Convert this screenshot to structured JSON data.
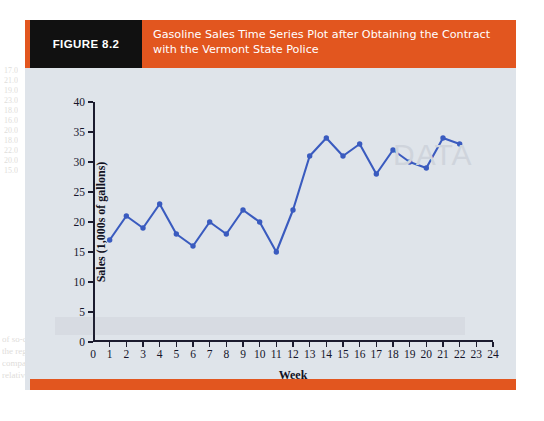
{
  "figure": {
    "tag": "FIGURE 8.2",
    "title": "Gasoline Sales Time Series Plot after Obtaining the Contract with the Vermont State Police",
    "header_color": "#e2561f",
    "tag_color": "#111111",
    "panel_color": "#dfe4ea"
  },
  "watermark": {
    "text": "DATA"
  },
  "page_bleed": [
    {
      "text": "17.0",
      "x": 4,
      "y": 66
    },
    {
      "text": "21.0",
      "x": 4,
      "y": 76
    },
    {
      "text": "19.0",
      "x": 4,
      "y": 86
    },
    {
      "text": "23.0",
      "x": 4,
      "y": 96
    },
    {
      "text": "18.0",
      "x": 4,
      "y": 106
    },
    {
      "text": "16.0",
      "x": 4,
      "y": 116
    },
    {
      "text": "20.0",
      "x": 4,
      "y": 126
    },
    {
      "text": "18.0",
      "x": 4,
      "y": 136
    },
    {
      "text": "22.0",
      "x": 4,
      "y": 146
    },
    {
      "text": "20.0",
      "x": 4,
      "y": 156
    },
    {
      "text": "15.0",
      "x": 4,
      "y": 166
    },
    {
      "text": "of so-called data increases by exception and the from time you to",
      "x": 2,
      "y": 334
    },
    {
      "text": "the regression appears to be growing at an exponential fashion. Figure",
      "x": 2,
      "y": 346
    },
    {
      "text": "comparison of seasonal and irregular components and trend in sales",
      "x": 2,
      "y": 358
    },
    {
      "text": "relatively constant.",
      "x": 2,
      "y": 370
    }
  ],
  "chart_data": {
    "type": "line",
    "title": "Gasoline Sales Time Series Plot after Obtaining the Contract with the Vermont State Police",
    "xlabel": "Week",
    "ylabel": "Sales (1,000s of gallons)",
    "x": [
      1,
      2,
      3,
      4,
      5,
      6,
      7,
      8,
      9,
      10,
      11,
      12,
      13,
      14,
      15,
      16,
      17,
      18,
      19,
      20,
      21,
      22
    ],
    "values": [
      17,
      21,
      19,
      23,
      18,
      16,
      20,
      18,
      22,
      20,
      15,
      22,
      31,
      34,
      31,
      33,
      28,
      32,
      30,
      29,
      34,
      33
    ],
    "series_name": "Gasoline Sales",
    "xlim": [
      0,
      24
    ],
    "ylim": [
      0,
      40
    ],
    "xticks": [
      0,
      1,
      2,
      3,
      4,
      5,
      6,
      7,
      8,
      9,
      10,
      11,
      12,
      13,
      14,
      15,
      16,
      17,
      18,
      19,
      20,
      21,
      22,
      23,
      24
    ],
    "yticks": [
      0,
      5,
      10,
      15,
      20,
      25,
      30,
      35,
      40
    ],
    "grid": false,
    "legend": "none",
    "line_color": "#3a5bbf",
    "marker": "circle",
    "marker_color": "#3a5bbf"
  }
}
